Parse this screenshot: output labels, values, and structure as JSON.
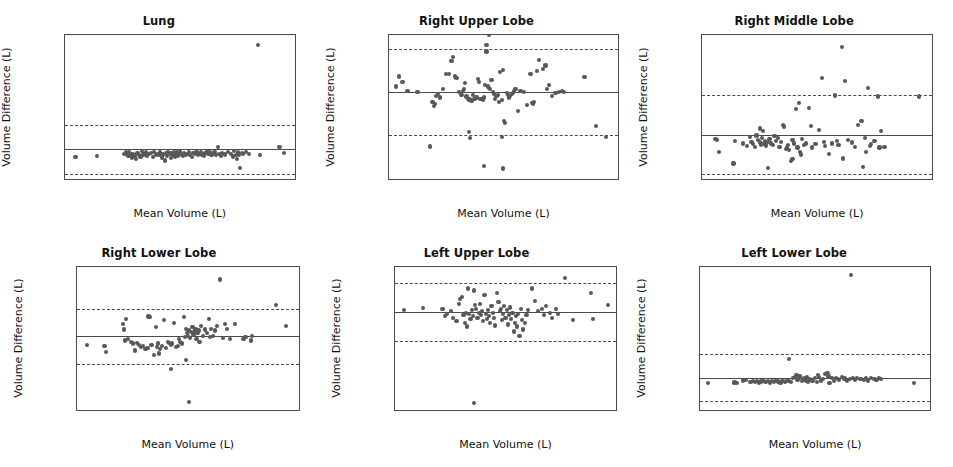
{
  "figure": {
    "type": "scatter-grid",
    "rows": 2,
    "columns": 3,
    "point_color": "#57585c",
    "line_color": "#4a4a4a"
  },
  "chart_data": [
    {
      "type": "scatter",
      "title": "Lung",
      "xlabel": "Mean Volume (L)",
      "ylabel": "Volume Difference (L)",
      "xlim": [
        1.0,
        8.6
      ],
      "ylim": [
        -0.3,
        0.94
      ],
      "xticks": [
        2,
        4,
        6,
        8
      ],
      "xticklabels": [
        "2",
        "4",
        "6",
        "8"
      ],
      "yticks": [
        -0.2,
        0.0,
        0.2,
        0.4,
        0.6,
        0.8
      ],
      "yticklabels": [
        "−0.2",
        "0.0",
        "0.2",
        "0.4",
        "0.6",
        "0.8"
      ],
      "grid": false,
      "mean_line": -0.046,
      "loa_upper": 0.166,
      "loa_lower": -0.262,
      "x": [
        1.35,
        2.05,
        2.95,
        3.02,
        3.05,
        3.1,
        3.12,
        3.18,
        3.22,
        3.25,
        3.3,
        3.35,
        3.4,
        3.45,
        3.5,
        3.55,
        3.6,
        3.62,
        3.68,
        3.72,
        3.78,
        3.85,
        3.9,
        3.95,
        4.0,
        4.05,
        4.1,
        4.15,
        4.2,
        4.25,
        4.3,
        4.35,
        4.38,
        4.42,
        4.45,
        4.5,
        4.52,
        4.55,
        4.6,
        4.62,
        4.65,
        4.68,
        4.7,
        4.75,
        4.78,
        4.8,
        4.85,
        4.9,
        4.95,
        5.0,
        5.05,
        5.1,
        5.15,
        5.2,
        5.25,
        5.3,
        5.35,
        5.4,
        5.45,
        5.5,
        5.55,
        5.6,
        5.65,
        5.7,
        5.75,
        5.8,
        5.85,
        5.9,
        5.95,
        6.0,
        6.05,
        6.1,
        6.15,
        6.2,
        6.3,
        6.4,
        6.5,
        6.55,
        6.6,
        6.65,
        6.7,
        6.72,
        6.75,
        6.8,
        6.85,
        6.9,
        7.0,
        7.1,
        7.4,
        7.45,
        8.1,
        8.25
      ],
      "y": [
        -0.113,
        -0.105,
        -0.088,
        -0.075,
        -0.095,
        -0.108,
        -0.072,
        -0.092,
        -0.118,
        -0.085,
        -0.102,
        -0.13,
        -0.078,
        -0.095,
        -0.11,
        -0.065,
        -0.088,
        -0.098,
        -0.075,
        -0.105,
        -0.09,
        -0.082,
        -0.112,
        -0.07,
        -0.095,
        -0.085,
        -0.1,
        -0.075,
        -0.118,
        -0.092,
        -0.145,
        -0.08,
        -0.105,
        -0.068,
        -0.09,
        -0.12,
        -0.082,
        -0.1,
        -0.072,
        -0.095,
        -0.11,
        -0.085,
        -0.075,
        -0.102,
        -0.092,
        -0.065,
        -0.088,
        -0.105,
        -0.078,
        -0.096,
        -0.085,
        -0.07,
        -0.1,
        -0.115,
        -0.082,
        -0.09,
        -0.073,
        -0.098,
        -0.088,
        -0.068,
        -0.092,
        -0.105,
        -0.08,
        -0.06,
        -0.09,
        -0.075,
        -0.1,
        -0.085,
        -0.072,
        -0.095,
        -0.03,
        -0.088,
        -0.105,
        -0.078,
        -0.092,
        -0.07,
        -0.085,
        -0.11,
        -0.062,
        -0.095,
        -0.132,
        -0.075,
        -0.1,
        -0.212,
        -0.082,
        -0.09,
        -0.07,
        -0.085,
        0.855,
        -0.095,
        -0.025,
        -0.082
      ]
    },
    {
      "type": "scatter",
      "title": "Right Upper Lobe",
      "xlabel": "Mean Volume (L)",
      "ylabel": "Volume Difference (L)",
      "xlim": [
        0.22,
        2.05
      ],
      "ylim": [
        -0.255,
        0.135
      ],
      "xticks": [
        0.5,
        1.0,
        1.5,
        2.0
      ],
      "xticklabels": [
        "0.5",
        "1.0",
        "1.5",
        "2.0"
      ],
      "yticks": [
        -0.2,
        -0.1,
        0.0,
        0.1
      ],
      "yticklabels": [
        "−0.2",
        "−0.1",
        "0.0",
        "0.1"
      ],
      "grid": false,
      "mean_line": -0.019,
      "loa_upper": 0.097,
      "loa_lower": -0.137,
      "x": [
        0.28,
        0.3,
        0.33,
        0.37,
        0.45,
        0.55,
        0.57,
        0.58,
        0.59,
        0.6,
        0.61,
        0.63,
        0.65,
        0.68,
        0.7,
        0.72,
        0.73,
        0.75,
        0.76,
        0.78,
        0.8,
        0.81,
        0.82,
        0.83,
        0.84,
        0.85,
        0.86,
        0.87,
        0.88,
        0.89,
        0.9,
        0.91,
        0.92,
        0.93,
        0.94,
        0.95,
        0.96,
        0.97,
        0.98,
        0.99,
        1.0,
        1.0,
        1.01,
        1.02,
        1.03,
        1.04,
        1.05,
        1.06,
        1.07,
        1.08,
        1.09,
        1.1,
        1.11,
        1.12,
        1.13,
        1.14,
        1.15,
        1.16,
        1.17,
        1.18,
        1.19,
        1.2,
        1.21,
        1.22,
        1.23,
        1.25,
        1.27,
        1.3,
        1.32,
        1.35,
        1.36,
        1.37,
        1.38,
        1.4,
        1.42,
        1.45,
        1.47,
        1.48,
        1.5,
        1.52,
        1.55,
        1.58,
        1.6,
        1.62,
        1.78,
        1.87,
        1.95,
        0.86,
        0.87,
        1.12,
        1.13,
        0.98,
        1.02
      ],
      "y": [
        -0.005,
        0.022,
        0.007,
        -0.018,
        -0.02,
        -0.168,
        -0.048,
        -0.058,
        -0.052,
        -0.03,
        -0.025,
        -0.035,
        -0.012,
        0.03,
        0.028,
        0.065,
        0.075,
        0.022,
        0.018,
        -0.02,
        -0.028,
        -0.018,
        -0.012,
        0.005,
        -0.032,
        -0.038,
        -0.042,
        -0.04,
        -0.045,
        -0.028,
        -0.04,
        -0.038,
        -0.035,
        0.015,
        0.008,
        -0.04,
        -0.038,
        -0.042,
        -0.035,
        0.0,
        0.108,
        0.09,
        -0.005,
        -0.008,
        -0.012,
        0.012,
        -0.02,
        -0.025,
        -0.038,
        -0.03,
        -0.028,
        -0.048,
        0.035,
        -0.042,
        0.04,
        -0.098,
        -0.105,
        -0.022,
        -0.028,
        -0.035,
        -0.03,
        -0.025,
        -0.022,
        -0.018,
        -0.012,
        -0.072,
        -0.018,
        -0.02,
        -0.055,
        0.028,
        -0.05,
        -0.052,
        -0.048,
        0.038,
        0.068,
        0.042,
        0.052,
        -0.012,
        0.0,
        -0.03,
        -0.022,
        -0.02,
        -0.018,
        -0.02,
        0.02,
        -0.112,
        -0.142,
        -0.128,
        -0.145,
        -0.143,
        -0.228,
        -0.22
      ]
    },
    {
      "type": "scatter",
      "title": "Right Middle Lobe",
      "xlabel": "Mean Volume (L)",
      "ylabel": "Volume Difference (L)",
      "xlim": [
        0.175,
        0.875
      ],
      "ylim": [
        -0.145,
        0.305
      ],
      "xticks": [
        0.2,
        0.3,
        0.4,
        0.5,
        0.6,
        0.7,
        0.8
      ],
      "xticklabels": [
        "0.2",
        "0.3",
        "0.4",
        "0.5",
        "0.6",
        "0.7",
        "0.8"
      ],
      "yticks": [
        -0.1,
        0.0,
        0.1,
        0.2,
        0.3
      ],
      "yticklabels": [
        "−0.1",
        "0.0",
        "0.1",
        "0.2",
        "0.3"
      ],
      "grid": false,
      "mean_line": -0.008,
      "loa_upper": 0.118,
      "loa_lower": -0.132,
      "x": [
        0.215,
        0.22,
        0.225,
        0.27,
        0.275,
        0.3,
        0.31,
        0.32,
        0.325,
        0.33,
        0.335,
        0.34,
        0.345,
        0.35,
        0.352,
        0.355,
        0.358,
        0.36,
        0.362,
        0.365,
        0.368,
        0.37,
        0.375,
        0.38,
        0.385,
        0.39,
        0.395,
        0.4,
        0.405,
        0.41,
        0.415,
        0.42,
        0.425,
        0.43,
        0.432,
        0.435,
        0.44,
        0.445,
        0.45,
        0.455,
        0.46,
        0.465,
        0.47,
        0.472,
        0.475,
        0.48,
        0.485,
        0.49,
        0.5,
        0.505,
        0.51,
        0.52,
        0.53,
        0.54,
        0.545,
        0.55,
        0.56,
        0.57,
        0.58,
        0.585,
        0.59,
        0.6,
        0.605,
        0.61,
        0.62,
        0.63,
        0.64,
        0.65,
        0.66,
        0.665,
        0.67,
        0.675,
        0.68,
        0.685,
        0.69,
        0.7,
        0.71,
        0.715,
        0.72,
        0.73,
        0.835,
        0.375,
        0.45
      ],
      "y": [
        -0.022,
        -0.025,
        -0.062,
        -0.098,
        -0.028,
        -0.035,
        -0.042,
        -0.015,
        -0.03,
        -0.038,
        -0.045,
        -0.01,
        -0.025,
        0.012,
        -0.032,
        -0.04,
        -0.018,
        0.005,
        -0.035,
        -0.028,
        -0.042,
        -0.038,
        -0.03,
        -0.022,
        -0.035,
        -0.04,
        -0.012,
        -0.028,
        -0.018,
        -0.045,
        -0.03,
        0.022,
        0.018,
        -0.052,
        -0.048,
        -0.04,
        -0.055,
        -0.09,
        -0.025,
        -0.035,
        0.072,
        -0.048,
        0.092,
        -0.062,
        -0.07,
        -0.022,
        -0.04,
        -0.035,
        0.075,
        0.02,
        -0.048,
        -0.038,
        0.008,
        0.17,
        -0.03,
        -0.042,
        -0.068,
        -0.035,
        0.115,
        -0.028,
        -0.04,
        0.268,
        -0.082,
        0.162,
        -0.025,
        -0.032,
        -0.045,
        0.022,
        0.035,
        -0.11,
        -0.018,
        -0.062,
        0.138,
        -0.042,
        -0.038,
        -0.028,
        0.112,
        -0.048,
        0.005,
        -0.045,
        0.112,
        -0.112,
        -0.085
      ]
    },
    {
      "type": "scatter",
      "title": "Right Lower Lobe",
      "xlabel": "Mean Volume (L)",
      "ylabel": "Volume Difference (L)",
      "xlim": [
        0.15,
        2.32
      ],
      "ylim": [
        -0.175,
        0.155
      ],
      "xticks": [
        0.5,
        1.0,
        1.5,
        2.0
      ],
      "xticklabels": [
        "0.5",
        "1.0",
        "1.5",
        "2.0"
      ],
      "yticks": [
        -0.15,
        -0.1,
        -0.05,
        0.0,
        0.05,
        0.1,
        0.15
      ],
      "yticklabels": [
        "−0.15",
        "−0.10",
        "−0.05",
        "0.00",
        "0.05",
        "0.10",
        "0.15"
      ],
      "grid": false,
      "mean_line": -0.004,
      "loa_upper": 0.058,
      "loa_lower": -0.069,
      "x": [
        0.25,
        0.42,
        0.43,
        0.6,
        0.61,
        0.62,
        0.63,
        0.65,
        0.68,
        0.7,
        0.72,
        0.74,
        0.76,
        0.78,
        0.8,
        0.82,
        0.84,
        0.85,
        0.86,
        0.88,
        0.9,
        0.92,
        0.93,
        0.94,
        0.95,
        0.96,
        0.98,
        1.0,
        1.02,
        1.04,
        1.05,
        1.07,
        1.08,
        1.1,
        1.12,
        1.14,
        1.15,
        1.16,
        1.18,
        1.2,
        1.21,
        1.22,
        1.23,
        1.24,
        1.25,
        1.26,
        1.27,
        1.28,
        1.29,
        1.3,
        1.31,
        1.32,
        1.33,
        1.34,
        1.35,
        1.36,
        1.38,
        1.4,
        1.42,
        1.44,
        1.45,
        1.46,
        1.48,
        1.5,
        1.52,
        1.55,
        1.58,
        1.6,
        1.62,
        1.65,
        1.7,
        1.78,
        1.8,
        1.85,
        1.86,
        2.1,
        2.2,
        1.07,
        1.22,
        1.25
      ],
      "y": [
        -0.025,
        -0.028,
        -0.042,
        0.022,
        0.01,
        -0.015,
        0.035,
        -0.012,
        -0.018,
        -0.022,
        -0.038,
        -0.02,
        -0.025,
        -0.03,
        -0.028,
        -0.035,
        -0.032,
        0.04,
        0.038,
        -0.025,
        -0.048,
        0.015,
        -0.03,
        -0.022,
        -0.045,
        -0.035,
        -0.028,
        0.032,
        -0.032,
        -0.018,
        -0.02,
        -0.025,
        -0.022,
        0.025,
        -0.03,
        -0.028,
        -0.012,
        -0.018,
        -0.022,
        0.038,
        -0.008,
        0.012,
        0.002,
        -0.005,
        0.008,
        -0.01,
        0.005,
        0.015,
        -0.002,
        0.004,
        0.01,
        -0.012,
        0.002,
        0.008,
        -0.018,
        0.018,
        -0.005,
        0.01,
        0.002,
        0.035,
        -0.008,
        0.012,
        -0.005,
        0.008,
        0.018,
        0.125,
        -0.01,
        0.022,
        0.012,
        -0.012,
        0.022,
        -0.012,
        -0.008,
        -0.015,
        -0.005,
        0.067,
        0.018,
        -0.08,
        -0.06,
        -0.157
      ]
    },
    {
      "type": "scatter",
      "title": "Left Upper Lobe",
      "xlabel": "Mean Volume (L)",
      "ylabel": "Volume Difference (L)",
      "xlim": [
        0.32,
        2.22
      ],
      "ylim": [
        -0.225,
        0.055
      ],
      "xticks": [
        0.5,
        1.0,
        1.5,
        2.0
      ],
      "xticklabels": [
        "0.5",
        "1.0",
        "1.5",
        "2.0"
      ],
      "yticks": [
        -0.2,
        -0.15,
        -0.1,
        -0.05,
        0.0,
        0.05
      ],
      "yticklabels": [
        "−0.20",
        "−0.15",
        "−0.10",
        "−0.05",
        "0.00",
        "0.05"
      ],
      "grid": false,
      "mean_line": -0.034,
      "loa_upper": 0.023,
      "loa_lower": -0.091,
      "x": [
        0.4,
        0.56,
        0.73,
        0.75,
        0.77,
        0.8,
        0.82,
        0.85,
        0.87,
        0.88,
        0.9,
        0.91,
        0.92,
        0.93,
        0.94,
        0.95,
        0.96,
        0.97,
        0.98,
        0.99,
        1.0,
        1.01,
        1.02,
        1.03,
        1.04,
        1.05,
        1.06,
        1.07,
        1.08,
        1.09,
        1.1,
        1.11,
        1.12,
        1.13,
        1.14,
        1.15,
        1.16,
        1.17,
        1.18,
        1.2,
        1.21,
        1.22,
        1.23,
        1.24,
        1.25,
        1.26,
        1.27,
        1.28,
        1.29,
        1.3,
        1.31,
        1.32,
        1.33,
        1.34,
        1.35,
        1.36,
        1.37,
        1.38,
        1.39,
        1.4,
        1.41,
        1.42,
        1.44,
        1.45,
        1.46,
        1.5,
        1.52,
        1.55,
        1.58,
        1.6,
        1.62,
        1.65,
        1.67,
        1.7,
        1.72,
        1.78,
        1.85,
        2.0,
        2.02,
        2.15,
        1.0
      ],
      "y": [
        -0.03,
        -0.026,
        -0.028,
        -0.042,
        -0.038,
        -0.032,
        -0.045,
        -0.052,
        -0.018,
        -0.008,
        -0.005,
        -0.04,
        -0.055,
        -0.035,
        -0.062,
        0.012,
        -0.038,
        -0.048,
        -0.03,
        -0.042,
        0.008,
        -0.02,
        -0.028,
        -0.045,
        -0.035,
        -0.018,
        -0.04,
        -0.032,
        -0.052,
        0.0,
        -0.038,
        -0.048,
        -0.03,
        -0.042,
        -0.055,
        -0.022,
        -0.035,
        -0.045,
        -0.06,
        0.004,
        -0.015,
        -0.032,
        -0.028,
        -0.05,
        -0.038,
        -0.022,
        -0.045,
        -0.03,
        -0.058,
        -0.04,
        -0.025,
        -0.048,
        -0.035,
        -0.072,
        -0.055,
        -0.042,
        -0.062,
        -0.038,
        -0.08,
        -0.028,
        -0.05,
        -0.068,
        -0.055,
        -0.04,
        -0.03,
        0.012,
        -0.012,
        -0.032,
        -0.028,
        -0.04,
        -0.022,
        -0.035,
        -0.045,
        -0.028,
        -0.038,
        0.032,
        -0.05,
        0.004,
        -0.048,
        -0.02,
        -0.211
      ]
    },
    {
      "type": "scatter",
      "title": "Left Lower Lobe",
      "xlabel": "Mean Volume (L)",
      "ylabel": "Volume Difference (L)",
      "xlim": [
        0.15,
        2.3
      ],
      "ylim": [
        -0.26,
        0.95
      ],
      "xticks": [
        0.5,
        1.0,
        1.5,
        2.0
      ],
      "xticklabels": [
        "0.5",
        "1.0",
        "1.5",
        "2.0"
      ],
      "yticks": [
        -0.2,
        0.0,
        0.2,
        0.4,
        0.6,
        0.8
      ],
      "yticklabels": [
        "−0.2",
        "0.0",
        "0.2",
        "0.4",
        "0.6",
        "0.8"
      ],
      "grid": false,
      "mean_line": 0.012,
      "loa_upper": 0.212,
      "loa_lower": -0.188,
      "x": [
        0.22,
        0.47,
        0.49,
        0.55,
        0.58,
        0.62,
        0.64,
        0.66,
        0.68,
        0.7,
        0.72,
        0.74,
        0.76,
        0.78,
        0.8,
        0.82,
        0.84,
        0.86,
        0.88,
        0.9,
        0.92,
        0.94,
        0.96,
        0.98,
        1.0,
        1.02,
        1.04,
        1.05,
        1.06,
        1.07,
        1.08,
        1.1,
        1.12,
        1.14,
        1.15,
        1.16,
        1.18,
        1.2,
        1.22,
        1.24,
        1.25,
        1.26,
        1.28,
        1.3,
        1.32,
        1.34,
        1.35,
        1.36,
        1.38,
        1.4,
        1.42,
        1.44,
        1.45,
        1.48,
        1.5,
        1.52,
        1.55,
        1.58,
        1.6,
        1.62,
        1.65,
        1.68,
        1.7,
        1.72,
        1.75,
        1.78,
        1.8,
        1.82,
        1.84,
        2.15,
        0.98,
        1.56
      ],
      "y": [
        -0.032,
        -0.028,
        -0.03,
        -0.012,
        -0.01,
        -0.022,
        -0.018,
        -0.025,
        -0.015,
        -0.028,
        -0.02,
        -0.012,
        -0.022,
        -0.018,
        -0.03,
        -0.015,
        -0.025,
        -0.01,
        -0.02,
        -0.028,
        -0.015,
        -0.022,
        -0.012,
        -0.018,
        -0.025,
        0.008,
        0.018,
        0.032,
        -0.01,
        0.012,
        0.022,
        -0.018,
        0.005,
        -0.012,
        0.015,
        -0.02,
        0.002,
        -0.015,
        0.008,
        -0.022,
        0.038,
        0.018,
        -0.012,
        0.002,
        0.045,
        0.055,
        0.022,
        -0.03,
        0.008,
        -0.018,
        0.012,
        0.002,
        -0.008,
        0.018,
        0.005,
        -0.012,
        0.002,
        0.008,
        -0.005,
        0.012,
        0.002,
        -0.008,
        0.005,
        -0.012,
        0.008,
        0.002,
        -0.005,
        0.01,
        0.004,
        -0.03,
        0.168,
        0.878
      ]
    }
  ]
}
